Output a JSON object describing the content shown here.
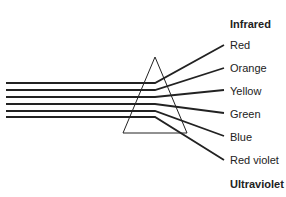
{
  "title_top": "Infrared",
  "title_bottom": "Ultraviolet",
  "colors": [
    "Red",
    "Orange",
    "Yellow",
    "Green",
    "Blue",
    "Red violet"
  ],
  "line_color": "#222222"
}
